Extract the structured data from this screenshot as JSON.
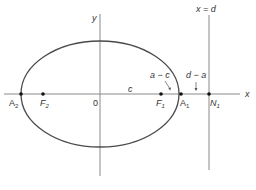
{
  "diagram": {
    "type": "ellipse-with-directrix",
    "colors": {
      "axes": "#8a8a8a",
      "ellipse": "#4a4a4a",
      "points": "#111111",
      "text": "#333333",
      "background": "#ffffff"
    },
    "axes": {
      "x_label": "x",
      "y_label": "y",
      "origin_label": "0"
    },
    "directrix": {
      "label": "x = d"
    },
    "points": [
      {
        "id": "A2",
        "label": "A",
        "sub": "2"
      },
      {
        "id": "F2",
        "label": "F",
        "sub": "2"
      },
      {
        "id": "F1",
        "label": "F",
        "sub": "1"
      },
      {
        "id": "A1",
        "label": "A",
        "sub": "1"
      },
      {
        "id": "N1",
        "label": "N",
        "sub": "1"
      }
    ],
    "annotations": {
      "c": "c",
      "a_minus_c": "a − c",
      "d_minus_a": "d − a"
    }
  }
}
